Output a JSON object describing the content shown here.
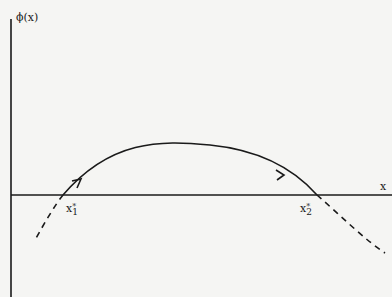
{
  "diagram": {
    "y_axis_label": "ϕ(x)",
    "x_axis_label": "x",
    "roots": [
      {
        "symbol": "x",
        "star": "*",
        "subscript": "1"
      },
      {
        "symbol": "x",
        "star": "*",
        "subscript": "2"
      }
    ],
    "colors": {
      "line": "#1a1a1a",
      "background": "#f5f5f3"
    }
  }
}
